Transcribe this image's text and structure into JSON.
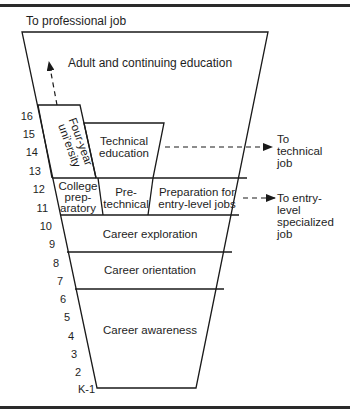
{
  "top_label": "To professional job",
  "levels": {
    "adult": "Adult and continuing education",
    "university_line1": "Four-year",
    "university_line2": "uni’ersity",
    "technical_line1": "Technical",
    "technical_line2": "education",
    "college_line1": "College",
    "college_line2": "prep-",
    "college_line3": "aratory",
    "pretech_line1": "Pre-",
    "pretech_line2": "technical",
    "prep_line1": "Preparation for",
    "prep_line2": "entry-level jobs",
    "exploration": "Career exploration",
    "orientation": "Career orientation",
    "awareness": "Career awareness"
  },
  "outputs": {
    "technical_line1": "To",
    "technical_line2": "technical",
    "technical_line3": "job",
    "entry_line1": "To entry-",
    "entry_line2": "level",
    "entry_line3": "specialized",
    "entry_line4": "job"
  },
  "grades": [
    "16",
    "15",
    "14",
    "13",
    "12",
    "11",
    "10",
    "9",
    "8",
    "7",
    "6",
    "5",
    "4",
    "3",
    "2",
    "K-1"
  ]
}
